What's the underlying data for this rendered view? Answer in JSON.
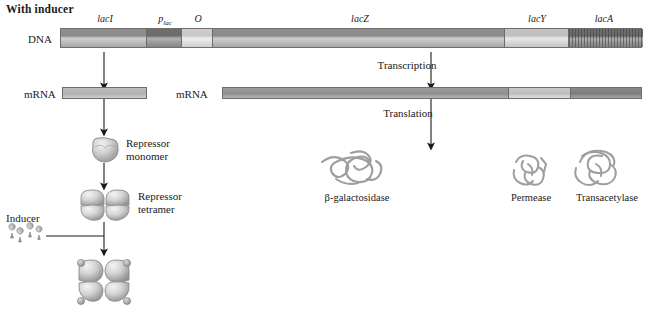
{
  "figure": {
    "title": "With inducer",
    "row_labels": {
      "dna": "DNA",
      "mrna_left": "mRNA",
      "mrna_right": "mRNA"
    },
    "gene_labels": {
      "laci": "lacI",
      "promoter": "p",
      "promoter_sub": "lac",
      "operator": "O",
      "lacz": "lacZ",
      "lacy": "lacY",
      "laca": "lacA"
    },
    "processes": {
      "transcription": "Transcription",
      "translation": "Translation"
    },
    "components": {
      "repressor_monomer_line1": "Repressor",
      "repressor_monomer_line2": "monomer",
      "repressor_tetramer_line1": "Repressor",
      "repressor_tetramer_line2": "tetramer",
      "inducer": "Inducer"
    },
    "proteins": [
      {
        "name": "β-galactosidase"
      },
      {
        "name": "Permease"
      },
      {
        "name": "Transacetylase"
      }
    ],
    "colors": {
      "background": "#ffffff",
      "ink": "#1a1a1a",
      "bar_outline": "#6d6d6d",
      "segment_mid": "#8f8f8f",
      "segment_dark": "#6f6f6f",
      "segment_light": "#cdcdcd",
      "segment_hatch": "#6e6e6e",
      "protein_outline": "#9a9a9a",
      "arrow": "#1a1a1a"
    }
  }
}
